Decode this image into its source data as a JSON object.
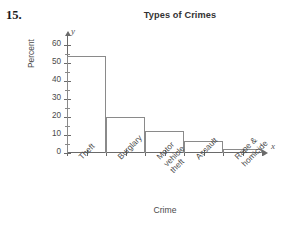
{
  "question_number": "15.",
  "chart_data": {
    "type": "bar",
    "title": "Types of Crimes",
    "xlabel": "Crime",
    "ylabel": "Percent",
    "categories": [
      "Theft",
      "Burglary",
      "Motor\nvehicle\ntheft",
      "Assault",
      "Rape &\nhomicide"
    ],
    "values": [
      54,
      20,
      12,
      6.5,
      2.5
    ],
    "ylim": [
      0,
      65
    ],
    "yticks": [
      0,
      10,
      20,
      30,
      40,
      50,
      60
    ],
    "ytick_labels": [
      "0",
      "10",
      "20",
      "30",
      "40",
      "50",
      "60"
    ],
    "yminor_step": 5,
    "grid": false,
    "legend": "none",
    "axis_letters": {
      "x": "x",
      "y": "y"
    },
    "style": "histogram-outline",
    "colors": {
      "axis": "#6a6a6a",
      "bar_outline": "#8a8a8a",
      "bar_fill": "transparent",
      "text": "#4a4a4a",
      "title": "#333333",
      "background": "#ffffff"
    }
  }
}
